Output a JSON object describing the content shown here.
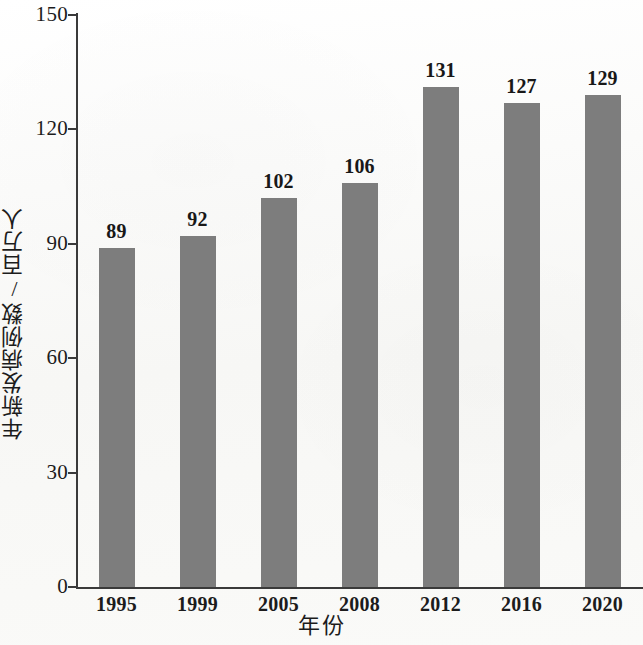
{
  "chart_data": {
    "type": "bar",
    "title": "",
    "xlabel": "年份",
    "ylabel": "年新发病例数/百万人",
    "categories": [
      "1995",
      "1999",
      "2005",
      "2008",
      "2012",
      "2016",
      "2020"
    ],
    "values": [
      89,
      92,
      102,
      106,
      131,
      127,
      129
    ],
    "value_labels": [
      "89",
      "92",
      "102",
      "106",
      "131",
      "127",
      "129"
    ],
    "ylim": [
      0,
      150
    ],
    "y_ticks": [
      0,
      30,
      60,
      90,
      120,
      150
    ],
    "y_tick_labels": [
      "0",
      "30",
      "60",
      "90",
      "120",
      "150"
    ],
    "grid": false,
    "legend": null,
    "series": [
      {
        "name": "年新发病例数",
        "values": [
          89,
          92,
          102,
          106,
          131,
          127,
          129
        ]
      }
    ],
    "colors": {
      "bar": "#7d7d7d",
      "axis": "#3a3a3a",
      "text": "#1c1c1c",
      "background": "#fbfbfa"
    }
  }
}
